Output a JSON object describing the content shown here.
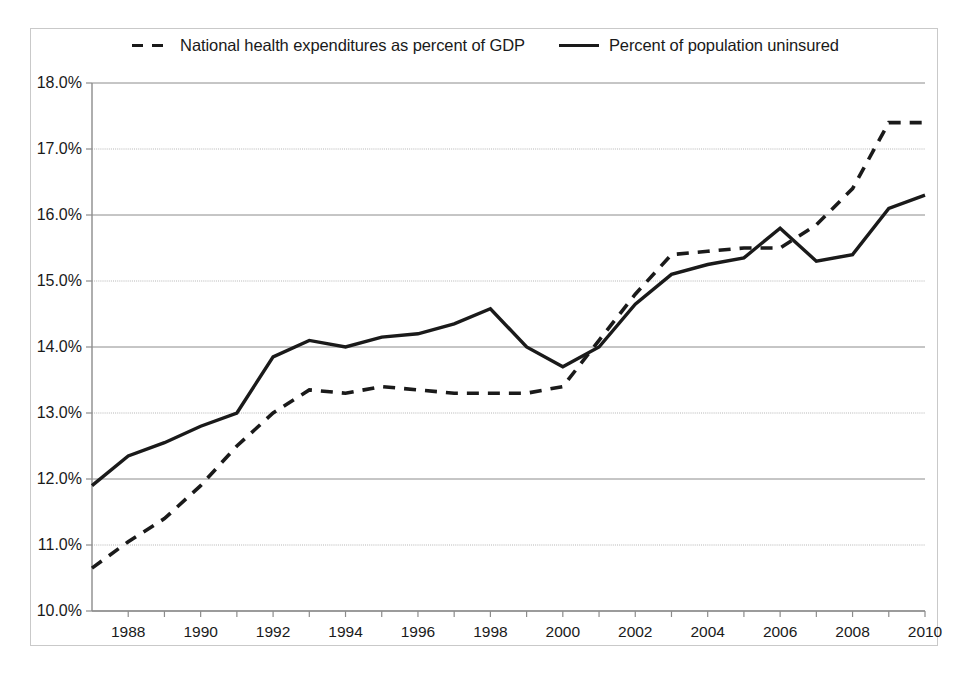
{
  "legend": {
    "entries": [
      {
        "label": "National health expenditures as percent of GDP",
        "style": "dashed",
        "key_name": "legend-key-dashed"
      },
      {
        "label": "Percent of population uninsured",
        "style": "solid",
        "key_name": "legend-key-solid"
      }
    ]
  },
  "axes": {
    "y_tick_labels": [
      "18.0%",
      "17.0%",
      "16.0%",
      "15.0%",
      "14.0%",
      "13.0%",
      "12.0%",
      "11.0%",
      "10.0%"
    ],
    "x_tick_labels": [
      "1988",
      "1990",
      "1992",
      "1994",
      "1996",
      "1998",
      "2000",
      "2002",
      "2004",
      "2006",
      "2008",
      "2010"
    ]
  },
  "chart_data": {
    "type": "line",
    "title": "",
    "xlabel": "",
    "ylabel": "",
    "xlim": [
      1987,
      2010
    ],
    "ylim": [
      10.0,
      18.0
    ],
    "ytick_values": [
      18.0,
      17.0,
      16.0,
      15.0,
      14.0,
      13.0,
      12.0,
      11.0,
      10.0
    ],
    "xtick_values": [
      1988,
      1990,
      1992,
      1994,
      1996,
      1998,
      2000,
      2002,
      2004,
      2006,
      2008,
      2010
    ],
    "grid": true,
    "legend_position": "top",
    "x": [
      1987,
      1988,
      1989,
      1990,
      1991,
      1992,
      1993,
      1994,
      1995,
      1996,
      1997,
      1998,
      1999,
      2000,
      2001,
      2002,
      2003,
      2004,
      2005,
      2006,
      2007,
      2008,
      2009,
      2010
    ],
    "series": [
      {
        "name": "National health expenditures as percent of GDP",
        "style": "dashed",
        "color": "#1a1a1a",
        "values": [
          10.65,
          11.05,
          11.4,
          11.9,
          12.5,
          13.0,
          13.35,
          13.3,
          13.4,
          13.35,
          13.3,
          13.3,
          13.3,
          13.4,
          14.1,
          14.8,
          15.4,
          15.45,
          15.5,
          15.5,
          15.85,
          16.4,
          17.4,
          17.4
        ]
      },
      {
        "name": "Percent of population uninsured",
        "style": "solid",
        "color": "#1a1a1a",
        "values": [
          11.9,
          12.35,
          12.55,
          12.8,
          13.0,
          13.85,
          14.1,
          14.0,
          14.15,
          14.2,
          14.35,
          14.58,
          14.0,
          13.7,
          14.0,
          14.65,
          15.1,
          15.25,
          15.35,
          15.8,
          15.3,
          15.4,
          16.1,
          16.3
        ]
      }
    ]
  },
  "plot_geometry": {
    "left_px": 92,
    "right_px": 925,
    "top_px": 83,
    "bottom_px": 611
  }
}
